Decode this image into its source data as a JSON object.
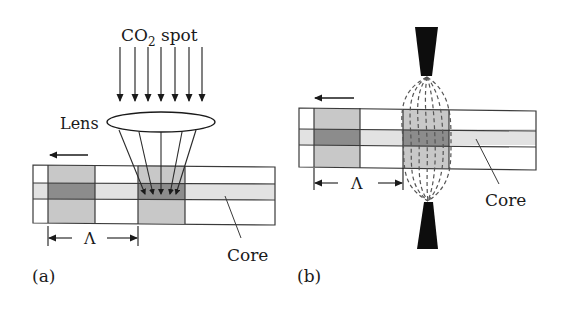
{
  "figure": {
    "panel_a": {
      "label": "(a)",
      "title": "CO2 laser writing through lens",
      "beam_label_main": "CO",
      "beam_label_sub": "2",
      "beam_label_rest": " spot",
      "lens_label": "Lens",
      "core_label": "Core",
      "period_label": "Λ",
      "beam_arrow_count": 7,
      "motion_direction": "left"
    },
    "panel_b": {
      "label": "(b)",
      "title": "Electric arc discharge writing",
      "core_label": "Core",
      "period_label": "Λ",
      "motion_direction": "left"
    },
    "colors": {
      "outline": "#3a3a3a",
      "cladding_modified": "#c8c8c8",
      "core_unmodified": "#e2e2e2",
      "core_modified": "#8c8c8c",
      "electrode": "#0d0d0d",
      "background": "#ffffff"
    }
  }
}
